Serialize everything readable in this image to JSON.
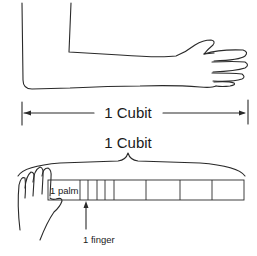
{
  "diagram": {
    "arm_measure": {
      "label": "1 Cubit"
    },
    "ruler_measure": {
      "label": "1 Cubit",
      "palm_label": "1 palm",
      "finger_label": "1 finger",
      "segments": [
        "palm",
        "finger",
        "finger",
        "finger",
        "finger",
        "palm",
        "palm",
        "palm",
        "palm"
      ]
    },
    "colors": {
      "line": "#2a2a2a",
      "text": "#1a1a1a",
      "background": "#ffffff"
    }
  }
}
